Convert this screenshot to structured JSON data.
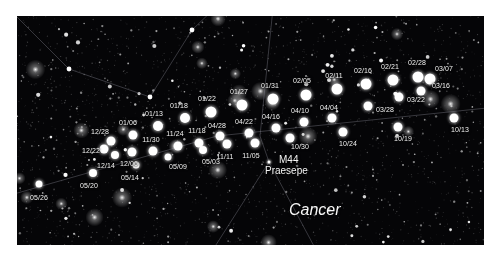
{
  "chart_data": {
    "type": "scatter",
    "xlabel": "",
    "ylabel": "",
    "background_color": "#050507",
    "marker_color": "#ffffff",
    "label_color": "#f2f2f2",
    "constellation_line_color": "#8a8a96",
    "frame": {
      "x": 17,
      "y": 16,
      "width": 467,
      "height": 229
    },
    "categories": [
      "05/26",
      "05/20",
      "05/14",
      "05/09",
      "05/03",
      "12/06",
      "12/14",
      "12/22",
      "12/28",
      "01/06",
      "11/30",
      "11/24",
      "11/18",
      "11/11",
      "11/05",
      "01/13",
      "01/18",
      "01/22",
      "01/27",
      "01/31",
      "04/28",
      "04/22",
      "04/16",
      "04/10",
      "04/04",
      "02/05",
      "02/11",
      "02/16",
      "02/21",
      "02/28",
      "03/07",
      "03/16",
      "03/22",
      "03/28",
      "10/30",
      "10/24",
      "10/19",
      "10/13"
    ],
    "points": [
      {
        "label": "05/26",
        "x": 22,
        "y": 168,
        "r": 3.5,
        "lx": 22,
        "ly": 182,
        "la": "center"
      },
      {
        "label": "05/20",
        "x": 76,
        "y": 157,
        "r": 4.0,
        "lx": 72,
        "ly": 170,
        "la": "center"
      },
      {
        "label": "05/14",
        "x": 119,
        "y": 149,
        "r": 3.5,
        "lx": 113,
        "ly": 162,
        "la": "center"
      },
      {
        "label": "05/09",
        "x": 151,
        "y": 141,
        "r": 3.5,
        "lx": 161,
        "ly": 151,
        "la": "center"
      },
      {
        "label": "05/03",
        "x": 186,
        "y": 134,
        "r": 4.0,
        "lx": 194,
        "ly": 146,
        "la": "center"
      },
      {
        "label": "12/06",
        "x": 115,
        "y": 136,
        "r": 4.5,
        "lx": 112,
        "ly": 148,
        "la": "center"
      },
      {
        "label": "12/14",
        "x": 98,
        "y": 139,
        "r": 4.0,
        "lx": 89,
        "ly": 150,
        "la": "center"
      },
      {
        "label": "12/22",
        "x": 87,
        "y": 133,
        "r": 4.5,
        "lx": 74,
        "ly": 135,
        "la": "center"
      },
      {
        "label": "12/28",
        "x": 94,
        "y": 125,
        "r": 4.5,
        "lx": 83,
        "ly": 116,
        "la": "center"
      },
      {
        "label": "01/06",
        "x": 116,
        "y": 119,
        "r": 4.5,
        "lx": 111,
        "ly": 107,
        "la": "center"
      },
      {
        "label": "11/30",
        "x": 136,
        "y": 135,
        "r": 4.5,
        "lx": 134,
        "ly": 124,
        "la": "center"
      },
      {
        "label": "11/24",
        "x": 161,
        "y": 130,
        "r": 4.5,
        "lx": 158,
        "ly": 118,
        "la": "center"
      },
      {
        "label": "11/18",
        "x": 182,
        "y": 127,
        "r": 4.5,
        "lx": 180,
        "ly": 115,
        "la": "center"
      },
      {
        "label": "11/11",
        "x": 210,
        "y": 128,
        "r": 4.5,
        "lx": 208,
        "ly": 141,
        "la": "center"
      },
      {
        "label": "11/05",
        "x": 238,
        "y": 127,
        "r": 4.5,
        "lx": 234,
        "ly": 140,
        "la": "center"
      },
      {
        "label": "01/13",
        "x": 141,
        "y": 110,
        "r": 5.0,
        "lx": 137,
        "ly": 98,
        "la": "center"
      },
      {
        "label": "01/18",
        "x": 168,
        "y": 102,
        "r": 5.0,
        "lx": 162,
        "ly": 90,
        "la": "center"
      },
      {
        "label": "01/22",
        "x": 194,
        "y": 96,
        "r": 5.5,
        "lx": 190,
        "ly": 83,
        "la": "center"
      },
      {
        "label": "01/27",
        "x": 225,
        "y": 89,
        "r": 5.5,
        "lx": 222,
        "ly": 76,
        "la": "center"
      },
      {
        "label": "01/31",
        "x": 256,
        "y": 83,
        "r": 5.5,
        "lx": 253,
        "ly": 70,
        "la": "center"
      },
      {
        "label": "04/28",
        "x": 203,
        "y": 120,
        "r": 4.5,
        "lx": 200,
        "ly": 110,
        "la": "center"
      },
      {
        "label": "04/22",
        "x": 232,
        "y": 117,
        "r": 4.5,
        "lx": 227,
        "ly": 106,
        "la": "center"
      },
      {
        "label": "04/16",
        "x": 259,
        "y": 112,
        "r": 4.5,
        "lx": 254,
        "ly": 101,
        "la": "center"
      },
      {
        "label": "04/10",
        "x": 287,
        "y": 106,
        "r": 4.5,
        "lx": 283,
        "ly": 95,
        "la": "center"
      },
      {
        "label": "04/04",
        "x": 315,
        "y": 102,
        "r": 4.5,
        "lx": 312,
        "ly": 92,
        "la": "center"
      },
      {
        "label": "02/05",
        "x": 289,
        "y": 79,
        "r": 5.5,
        "lx": 285,
        "ly": 65,
        "la": "center"
      },
      {
        "label": "02/11",
        "x": 320,
        "y": 73,
        "r": 5.5,
        "lx": 317,
        "ly": 60,
        "la": "center"
      },
      {
        "label": "02/16",
        "x": 349,
        "y": 68,
        "r": 5.5,
        "lx": 346,
        "ly": 55,
        "la": "center"
      },
      {
        "label": "02/21",
        "x": 376,
        "y": 64,
        "r": 5.5,
        "lx": 373,
        "ly": 51,
        "la": "center"
      },
      {
        "label": "02/28",
        "x": 401,
        "y": 61,
        "r": 5.5,
        "lx": 400,
        "ly": 47,
        "la": "center"
      },
      {
        "label": "03/07",
        "x": 413,
        "y": 63,
        "r": 5.5,
        "lx": 427,
        "ly": 53,
        "la": "center"
      },
      {
        "label": "03/16",
        "x": 404,
        "y": 75,
        "r": 4.5,
        "lx": 424,
        "ly": 70,
        "la": "center"
      },
      {
        "label": "03/22",
        "x": 382,
        "y": 81,
        "r": 4.5,
        "lx": 399,
        "ly": 84,
        "la": "center"
      },
      {
        "label": "03/28",
        "x": 351,
        "y": 90,
        "r": 4.5,
        "lx": 368,
        "ly": 94,
        "la": "center"
      },
      {
        "label": "10/30",
        "x": 273,
        "y": 122,
        "r": 4.5,
        "lx": 283,
        "ly": 131,
        "la": "center"
      },
      {
        "label": "10/24",
        "x": 326,
        "y": 116,
        "r": 4.5,
        "lx": 331,
        "ly": 128,
        "la": "center"
      },
      {
        "label": "10/19",
        "x": 381,
        "y": 111,
        "r": 4.5,
        "lx": 386,
        "ly": 123,
        "la": "center"
      },
      {
        "label": "10/13",
        "x": 437,
        "y": 102,
        "r": 4.5,
        "lx": 443,
        "ly": 114,
        "la": "center"
      }
    ],
    "deep_sky_objects": [
      {
        "name_line1": "M44",
        "name_line2": "Praesepe",
        "x": 252,
        "y": 146,
        "label_x": 262,
        "label_y": 138
      }
    ],
    "constellations": [
      {
        "name": "Cancer",
        "x": 272,
        "y": 185
      }
    ],
    "constellation_lines": [
      {
        "x1": -6,
        "y1": -5,
        "x2": 52,
        "y2": 53
      },
      {
        "x1": 52,
        "y1": 53,
        "x2": 133,
        "y2": 81
      },
      {
        "x1": 133,
        "y1": 81,
        "x2": 175,
        "y2": 14
      },
      {
        "x1": 175,
        "y1": 14,
        "x2": 200,
        "y2": -10
      },
      {
        "x1": 256,
        "y1": -8,
        "x2": 243,
        "y2": 120
      },
      {
        "x1": 243,
        "y1": 120,
        "x2": 252,
        "y2": 146
      },
      {
        "x1": 252,
        "y1": 146,
        "x2": 197,
        "y2": 232
      },
      {
        "x1": 252,
        "y1": 146,
        "x2": 298,
        "y2": 232
      },
      {
        "x1": -10,
        "y1": 180,
        "x2": 200,
        "y2": 120
      },
      {
        "x1": 200,
        "y1": 120,
        "x2": 470,
        "y2": 92
      }
    ]
  }
}
